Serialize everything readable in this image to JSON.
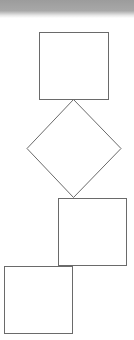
{
  "diagram": {
    "background": "#ffffff",
    "header_band": {
      "color_top": "#9c9c9c",
      "color_bottom": "#ffffff"
    },
    "stroke_color": "#6a6a6a",
    "shapes": [
      {
        "id": "square-1",
        "type": "rect",
        "x": 39.5,
        "y": 32.5,
        "w": 69,
        "h": 67
      },
      {
        "id": "diamond-1",
        "type": "diamond",
        "cx": 73.5,
        "top": 99.5,
        "bottom": 197.5,
        "left": 27,
        "right": 121
      },
      {
        "id": "square-2",
        "type": "rect",
        "x": 58.5,
        "y": 198.5,
        "w": 68,
        "h": 67
      },
      {
        "id": "square-3",
        "type": "rect",
        "x": 4.5,
        "y": 266.5,
        "w": 68,
        "h": 67
      }
    ]
  }
}
